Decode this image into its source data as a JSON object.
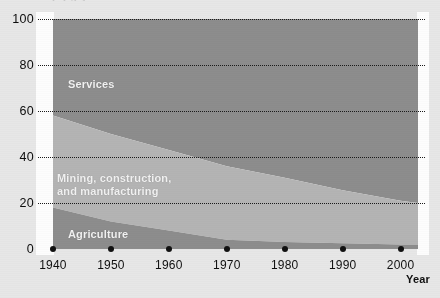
{
  "figure": {
    "cropped_title_fragment": "p  j  g  y",
    "axis_title_x": "Year"
  },
  "labels": {
    "services": "Services",
    "mining": "Mining, construction,\nand manufacturing",
    "agriculture": "Agriculture"
  },
  "colors": {
    "services_band": "#8d8d8d",
    "mining_band": "#b4b4b4",
    "agriculture_band": "#8d8d8d",
    "plot_background": "#fdfdfd",
    "page_background": "#e7e7e7",
    "gridline": "#1a1a1a",
    "tick_dot": "#111111",
    "band_label_text": "#f2f2f2"
  },
  "chart_data": {
    "type": "area",
    "title": "",
    "xlabel": "Year",
    "ylabel": "",
    "xlim": [
      1940,
      2003
    ],
    "ylim": [
      0,
      100
    ],
    "grid": true,
    "legend": "inline band labels",
    "stacked": true,
    "x": [
      1940,
      1950,
      1960,
      1970,
      1980,
      1990,
      2000,
      2003
    ],
    "xticks": [
      1940,
      1950,
      1960,
      1970,
      1980,
      1990,
      2000
    ],
    "xticklabels": [
      "1940",
      "1950",
      "1960",
      "1970",
      "1980",
      "1990",
      "2000"
    ],
    "yticks": [
      0,
      20,
      40,
      60,
      80,
      100
    ],
    "yticklabels": [
      "0",
      "20",
      "40",
      "60",
      "80",
      "100"
    ],
    "series": [
      {
        "name": "Agriculture",
        "values": [
          18,
          12,
          8,
          4,
          3,
          2.5,
          2,
          2
        ]
      },
      {
        "name": "Mining, construction, and manufacturing",
        "values": [
          40,
          38,
          35,
          32,
          28,
          23,
          19,
          18
        ]
      },
      {
        "name": "Services",
        "values": [
          42,
          50,
          57,
          64,
          69,
          74.5,
          79,
          80
        ]
      }
    ],
    "cumulative_upper_bounds": {
      "agriculture_top": [
        18,
        12,
        8,
        4,
        3,
        2.5,
        2,
        2
      ],
      "mining_top": [
        58,
        50,
        43,
        36,
        31,
        25.5,
        21,
        20
      ],
      "services_top": [
        100,
        100,
        100,
        100,
        100,
        100,
        100,
        100
      ]
    }
  }
}
